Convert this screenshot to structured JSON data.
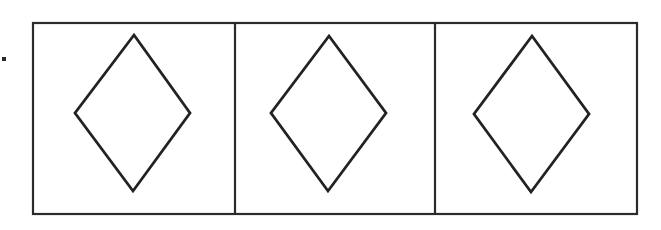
{
  "figure": {
    "type": "shape-sequence",
    "panel_count": 3,
    "bullet": {
      "shape": "square-dot",
      "x": 2,
      "y": 57,
      "size": 4
    },
    "outer_frame": {
      "x": 33,
      "y": 23,
      "width": 604,
      "height": 191
    },
    "dividers_x": [
      235,
      435
    ],
    "panels": [
      {
        "index": 1,
        "shape": "diamond",
        "points": "134,35 190,113 133,191 75,113"
      },
      {
        "index": 2,
        "shape": "diamond",
        "points": "329,36 386,113 328,191 271,113"
      },
      {
        "index": 3,
        "shape": "diamond",
        "points": "532,36 589,114 531,192 474,114"
      }
    ],
    "colors": {
      "stroke": "#222222",
      "background": "#ffffff"
    }
  }
}
